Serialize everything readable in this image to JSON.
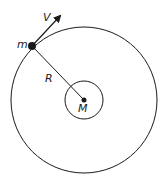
{
  "diagram": {
    "title": "",
    "labels": {
      "small_mass": "m",
      "velocity": "V",
      "radius": "R",
      "central_mass": "M"
    },
    "colors": {
      "stroke": "#1a1a1a",
      "background": "#ffffff"
    },
    "geometry": {
      "outer_orbit": {
        "cx": 84,
        "cy": 100,
        "r": 73
      },
      "inner_body": {
        "cx": 84,
        "cy": 100,
        "r": 19
      },
      "small_mass_position": {
        "x": 32,
        "y": 46
      },
      "central_mass_position": {
        "x": 84,
        "y": 100
      }
    }
  }
}
